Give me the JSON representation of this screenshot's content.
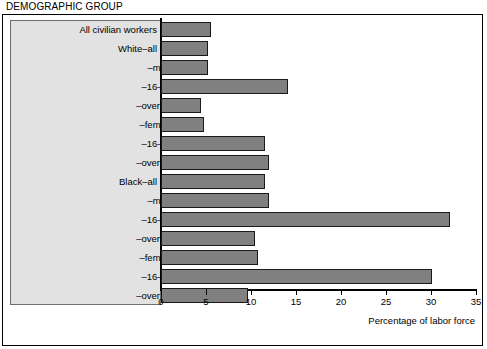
{
  "chart_data": {
    "type": "bar",
    "orientation": "horizontal",
    "title": "DEMOGRAPHIC GROUP",
    "xlabel": "Percentage of labor force",
    "ylabel": "",
    "xlim": [
      0,
      35
    ],
    "xticks": [
      0,
      5,
      10,
      15,
      20,
      25,
      30,
      35
    ],
    "xtick_labels": [
      "0",
      "5",
      "10",
      "15",
      "20",
      "25",
      "30",
      "35"
    ],
    "grid": false,
    "legend": "none",
    "bar_color": "#808080",
    "bar_edge_color": "#1a1a1a",
    "panel_color": "#e2e2e2",
    "categories": [
      "All civilian workers",
      "White–all",
      "–males",
      "–16–19 years",
      "–over 19 years",
      "–females",
      "–16–19 years",
      "–over 19 years",
      "Black–all",
      "–males",
      "–16–19 years",
      "–over 19 years",
      "–females",
      "–16–19 years",
      "–over 19 years"
    ],
    "values": [
      5.6,
      5.2,
      5.2,
      14.1,
      4.4,
      4.8,
      11.6,
      12.0,
      11.6,
      12.0,
      32.1,
      10.4,
      10.8,
      30.1,
      9.7
    ],
    "indent_levels": [
      0,
      0,
      1,
      2,
      2,
      1,
      2,
      2,
      0,
      1,
      2,
      2,
      1,
      2,
      2
    ]
  }
}
